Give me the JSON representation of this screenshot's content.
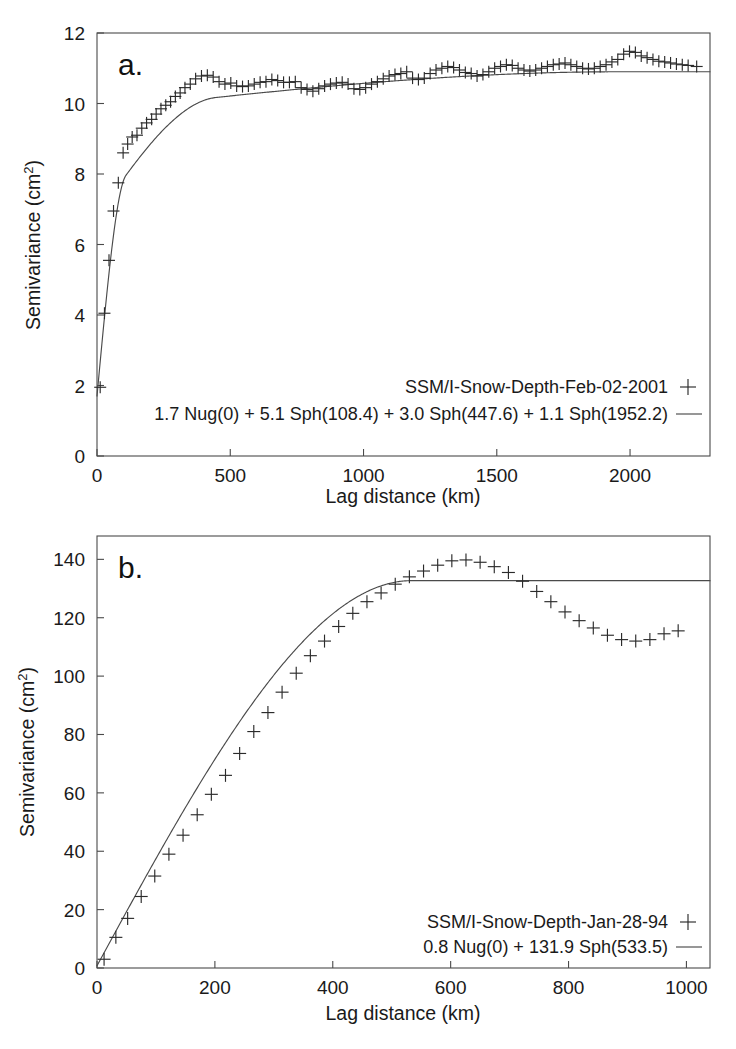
{
  "figure": {
    "panel_a_label": "a.",
    "panel_b_label": "b."
  },
  "chart_data": [
    {
      "id": "panel-a",
      "type": "scatter",
      "title": "",
      "panel_label": "a.",
      "xlabel": "Lag distance (km)",
      "ylabel": "Semivariance (cm2)",
      "ylabel_base": "Semivariance (cm",
      "ylabel_sup": "2",
      "ylabel_tail": ")",
      "xlim": [
        0,
        2300
      ],
      "ylim": [
        0,
        12
      ],
      "xticks": [
        0,
        500,
        1000,
        1500,
        2000
      ],
      "yticks": [
        0,
        2,
        4,
        6,
        8,
        10,
        12
      ],
      "grid": false,
      "legend_position": "inside-bottom-right",
      "legend": [
        {
          "label": "SSM/I-Snow-Depth-Feb-02-2001",
          "marker": "plus"
        },
        {
          "label": "1.7 Nug(0) + 5.1 Sph(108.4) + 3.0 Sph(447.6) + 1.1 Sph(1952.2)",
          "marker": "line"
        }
      ],
      "series": [
        {
          "name": "SSM/I-Snow-Depth-Feb-02-2001",
          "marker": "plus",
          "x": [
            12,
            28,
            45,
            62,
            80,
            98,
            115,
            132,
            150,
            168,
            186,
            205,
            222,
            240,
            258,
            276,
            294,
            312,
            330,
            350,
            370,
            392,
            414,
            436,
            458,
            480,
            502,
            524,
            546,
            568,
            590,
            612,
            634,
            656,
            678,
            700,
            722,
            744,
            766,
            788,
            810,
            832,
            854,
            876,
            898,
            920,
            942,
            964,
            986,
            1008,
            1030,
            1052,
            1074,
            1096,
            1118,
            1140,
            1162,
            1184,
            1206,
            1228,
            1250,
            1272,
            1294,
            1316,
            1338,
            1360,
            1382,
            1404,
            1426,
            1448,
            1470,
            1492,
            1514,
            1536,
            1558,
            1580,
            1602,
            1624,
            1646,
            1668,
            1690,
            1712,
            1734,
            1756,
            1778,
            1800,
            1822,
            1844,
            1866,
            1888,
            1910,
            1932,
            1954,
            1976,
            1998,
            2020,
            2042,
            2064,
            2086,
            2108,
            2130,
            2152,
            2174,
            2196,
            2218,
            2250
          ],
          "y": [
            1.95,
            4.05,
            5.55,
            6.95,
            7.75,
            8.6,
            8.85,
            9.05,
            9.1,
            9.3,
            9.45,
            9.55,
            9.7,
            9.85,
            9.95,
            10.05,
            10.2,
            10.3,
            10.45,
            10.55,
            10.7,
            10.78,
            10.8,
            10.75,
            10.62,
            10.55,
            10.58,
            10.5,
            10.48,
            10.5,
            10.55,
            10.6,
            10.62,
            10.68,
            10.65,
            10.6,
            10.6,
            10.62,
            10.45,
            10.4,
            10.35,
            10.42,
            10.5,
            10.55,
            10.58,
            10.6,
            10.55,
            10.42,
            10.4,
            10.45,
            10.55,
            10.62,
            10.7,
            10.78,
            10.82,
            10.85,
            10.9,
            10.72,
            10.68,
            10.72,
            10.85,
            10.95,
            11.0,
            11.05,
            11.02,
            10.95,
            10.88,
            10.85,
            10.78,
            10.82,
            10.9,
            11.0,
            11.05,
            11.1,
            11.08,
            11.0,
            10.95,
            10.92,
            10.95,
            11.0,
            11.05,
            11.1,
            11.12,
            11.15,
            11.1,
            11.05,
            11.0,
            10.98,
            11.0,
            11.05,
            11.1,
            11.18,
            11.25,
            11.4,
            11.48,
            11.45,
            11.35,
            11.3,
            11.25,
            11.2,
            11.18,
            11.15,
            11.12,
            11.1,
            11.08,
            11.05,
            10.7
          ]
        }
      ],
      "model": {
        "name": "1.7 Nug(0) + 5.1 Sph(108.4) + 3.0 Sph(447.6) + 1.1 Sph(1952.2)",
        "nugget": 1.7,
        "structures": [
          {
            "type": "Sph",
            "sill": 5.1,
            "range": 108.4
          },
          {
            "type": "Sph",
            "sill": 3.0,
            "range": 447.6
          },
          {
            "type": "Sph",
            "sill": 1.1,
            "range": 1952.2
          }
        ]
      }
    },
    {
      "id": "panel-b",
      "type": "scatter",
      "title": "",
      "panel_label": "b.",
      "xlabel": "Lag distance (km)",
      "ylabel": "Semivariance (cm2)",
      "ylabel_base": "Semivariance (cm",
      "ylabel_sup": "2",
      "ylabel_tail": ")",
      "xlim": [
        0,
        1040
      ],
      "ylim": [
        0,
        148
      ],
      "xticks": [
        0,
        200,
        400,
        600,
        800,
        1000
      ],
      "yticks": [
        0,
        20,
        40,
        60,
        80,
        100,
        120,
        140
      ],
      "grid": false,
      "legend_position": "inside-bottom-right",
      "legend": [
        {
          "label": "SSM/I-Snow-Depth-Jan-28-94",
          "marker": "plus"
        },
        {
          "label": "0.8 Nug(0) + 131.9 Sph(533.5)",
          "marker": "line"
        }
      ],
      "series": [
        {
          "name": "SSM/I-Snow-Depth-Jan-28-94",
          "marker": "plus",
          "x": [
            12,
            32,
            52,
            75,
            98,
            122,
            146,
            170,
            194,
            218,
            242,
            266,
            290,
            314,
            338,
            362,
            386,
            410,
            434,
            458,
            482,
            506,
            530,
            554,
            578,
            602,
            626,
            650,
            674,
            698,
            722,
            746,
            770,
            794,
            818,
            842,
            866,
            890,
            914,
            938,
            962,
            986
          ],
          "y": [
            3.0,
            10.5,
            17.0,
            24.5,
            31.5,
            39.0,
            45.5,
            52.5,
            59.5,
            66.0,
            73.5,
            81.0,
            87.5,
            94.5,
            101.0,
            107.0,
            112.0,
            117.0,
            121.5,
            125.5,
            128.5,
            131.5,
            134.0,
            136.0,
            138.0,
            139.5,
            139.8,
            139.0,
            137.5,
            135.5,
            132.5,
            129.0,
            125.5,
            122.0,
            119.0,
            116.5,
            114.0,
            112.5,
            112.0,
            112.5,
            114.5,
            115.5
          ]
        }
      ],
      "model": {
        "name": "0.8 Nug(0) + 131.9 Sph(533.5)",
        "nugget": 0.8,
        "structures": [
          {
            "type": "Sph",
            "sill": 131.9,
            "range": 533.5
          }
        ]
      }
    }
  ]
}
